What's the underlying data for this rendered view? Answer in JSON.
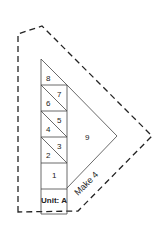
{
  "diagram": {
    "type": "quilt-piecing-unit",
    "unit_label": "Unit: A",
    "quantity_label": "Make 4",
    "pieces": [
      {
        "id": "1",
        "label": "1"
      },
      {
        "id": "2",
        "label": "2"
      },
      {
        "id": "3",
        "label": "3"
      },
      {
        "id": "4",
        "label": "4"
      },
      {
        "id": "5",
        "label": "5"
      },
      {
        "id": "6",
        "label": "6"
      },
      {
        "id": "7",
        "label": "7"
      },
      {
        "id": "8",
        "label": "8"
      },
      {
        "id": "9",
        "label": "9"
      }
    ],
    "colors": {
      "line": "#333333",
      "dash": "#222222",
      "background": "#ffffff"
    }
  }
}
